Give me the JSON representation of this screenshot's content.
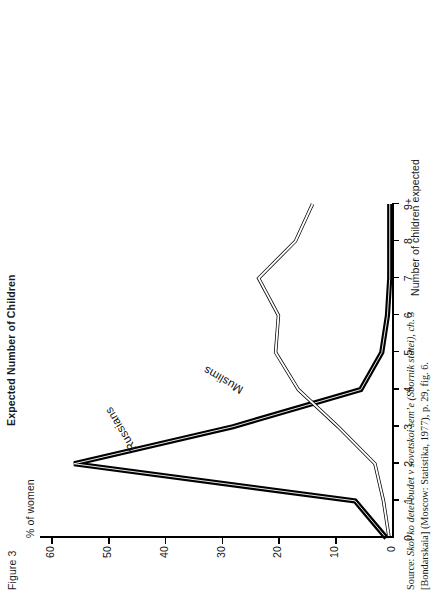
{
  "figure": {
    "number_label": "Figure 3",
    "title": "Expected Number of Children"
  },
  "axes": {
    "y_caption": "% of women",
    "x_caption": "Number of children expected",
    "y_ticks": [
      "0",
      "10",
      "20",
      "30",
      "40",
      "50",
      "60"
    ],
    "x_ticks": [
      "0",
      "1",
      "2",
      "3",
      "4",
      "5",
      "6",
      "7",
      "8",
      "9+"
    ],
    "y_range": [
      0,
      62
    ],
    "x_range": [
      0,
      9
    ]
  },
  "series_labels": {
    "russians": "Russians",
    "muslims": "Muslims"
  },
  "source": {
    "prefix": "Source:",
    "text_1": "Skolʼko detei budet v sovetskoi semʼe (Sbornik statei), ch. 3",
    "text_2": "[Bondarskaia] (Moscow: Statistika, 1977), p. 29, fig. 6."
  },
  "chart_data": {
    "type": "line",
    "title": "Expected Number of Children",
    "xlabel": "Number of children expected",
    "ylabel": "% of women",
    "x": [
      0,
      1,
      2,
      3,
      4,
      5,
      6,
      7,
      8,
      9
    ],
    "xtick_labels": [
      "0",
      "1",
      "2",
      "3",
      "4",
      "5",
      "6",
      "7",
      "8",
      "9+"
    ],
    "xlim": [
      0,
      9
    ],
    "ylim": [
      0,
      62
    ],
    "ytick_labels": [
      "0",
      "10",
      "20",
      "30",
      "40",
      "50",
      "60"
    ],
    "grid": false,
    "legend": "inline-annotations",
    "series": [
      {
        "name": "Russians",
        "style": "solid-thick-black",
        "values": [
          1.0,
          6.5,
          56.0,
          28.0,
          5.5,
          1.8,
          0.8,
          0.4,
          0.4,
          0.4
        ]
      },
      {
        "name": "Muslims",
        "style": "outline-white",
        "values": [
          0.5,
          1.5,
          3.0,
          9.5,
          16.5,
          20.5,
          20.0,
          23.5,
          17.0,
          14.0
        ]
      }
    ]
  }
}
